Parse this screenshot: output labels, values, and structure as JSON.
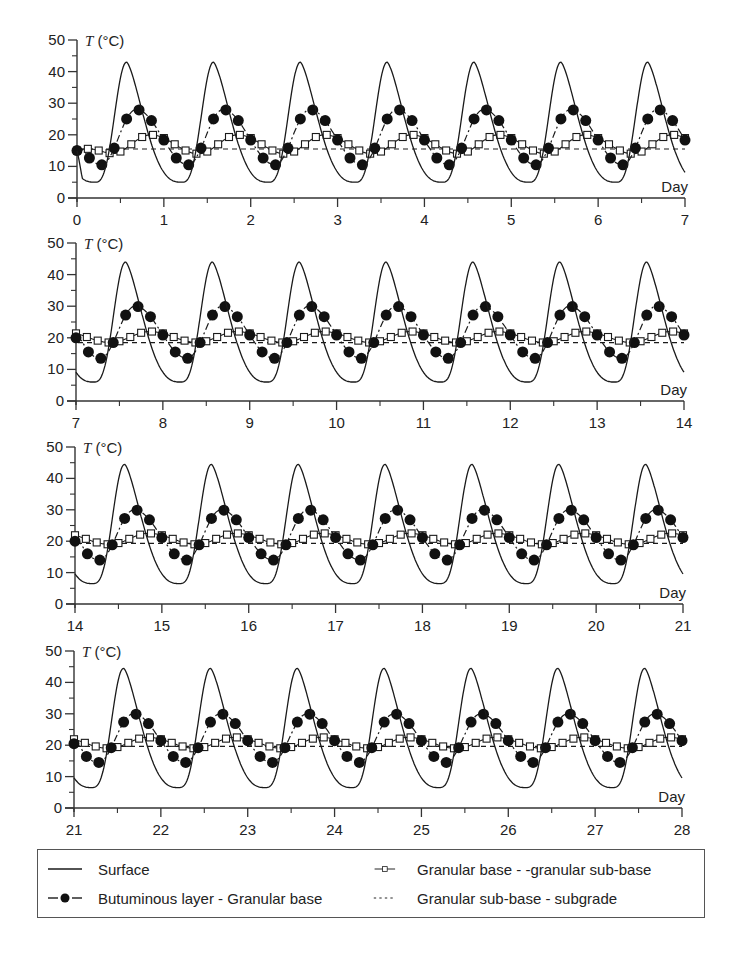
{
  "chart_data": {
    "type": "line",
    "title": "",
    "ylabel": "T (°C)",
    "xlabel": "Day",
    "ylim": [
      0,
      50
    ],
    "yticks": [
      0,
      10,
      20,
      30,
      40,
      50
    ],
    "grid": false,
    "legend_position": "bottom (boxed, 2 columns)",
    "panels": [
      {
        "xlim": [
          0,
          7
        ],
        "xticks": [
          "0",
          "1",
          "2",
          "3",
          "4",
          "5",
          "6",
          "7"
        ]
      },
      {
        "xlim": [
          7,
          14
        ],
        "xticks": [
          "7",
          "8",
          "9",
          "10",
          "11",
          "12",
          "13",
          "14"
        ]
      },
      {
        "xlim": [
          14,
          21
        ],
        "xticks": [
          "14",
          "15",
          "16",
          "17",
          "18",
          "19",
          "20",
          "21"
        ]
      },
      {
        "xlim": [
          21,
          28
        ],
        "xticks": [
          "21",
          "22",
          "23",
          "24",
          "25",
          "26",
          "27",
          "28"
        ]
      }
    ],
    "series": [
      {
        "name": "Surface",
        "style": "solid",
        "marker": "none",
        "daily_cycle": {
          "min": 5.5,
          "min_time_of_day": 0.2,
          "max": 43.5,
          "max_time_of_day": 0.57
        },
        "daily_peaks_by_panel": [
          43,
          44,
          44.5,
          44.5
        ],
        "daily_minima_by_panel": [
          5,
          6,
          6.5,
          6.5
        ]
      },
      {
        "name": "Butuminous layer - Granular base",
        "style": "dash-dot",
        "marker": "filled-circle",
        "daily_cycle": {
          "min": 12,
          "min_time_of_day": 0.28,
          "max": 28.5,
          "max_time_of_day": 0.68
        },
        "daily_peaks_by_panel": [
          28,
          30,
          30,
          30
        ],
        "daily_minima_by_panel": [
          10.5,
          13.5,
          14,
          14.5
        ],
        "start_value_by_panel": [
          15,
          20,
          20,
          20.5
        ]
      },
      {
        "name": "Granular base - -granular sub-base",
        "style": "solid-thin",
        "marker": "open-square",
        "daily_cycle": {
          "min": 15,
          "min_time_of_day": 0.4,
          "max": 20,
          "max_time_of_day": 0.85
        },
        "daily_peaks_by_panel": [
          20,
          22,
          22.5,
          22.5
        ],
        "daily_minima_by_panel": [
          14,
          18.5,
          19,
          19
        ],
        "start_value_by_panel": [
          15,
          22,
          22.5,
          22.5
        ]
      },
      {
        "name": "Granular sub-base - subgrade",
        "style": "dashed",
        "marker": "none",
        "level_by_panel": [
          15.5,
          18.5,
          19.3,
          19.6
        ]
      }
    ]
  },
  "axis": {
    "y_label_symbol": "T",
    "y_label_unit": " (°C)",
    "x_label": "Day"
  },
  "legend": {
    "items": [
      {
        "label": "Surface",
        "swatch": "solid-line"
      },
      {
        "label": "Granular base - -granular sub-base",
        "swatch": "line-open-square"
      },
      {
        "label": "Butuminous layer - Granular base",
        "swatch": "dash-filled-circle"
      },
      {
        "label": "Granular sub-base - subgrade",
        "swatch": "dashed-line"
      }
    ]
  },
  "colors": {
    "ink": "#1a1a1a",
    "background": "#ffffff",
    "axis": "#333333"
  }
}
